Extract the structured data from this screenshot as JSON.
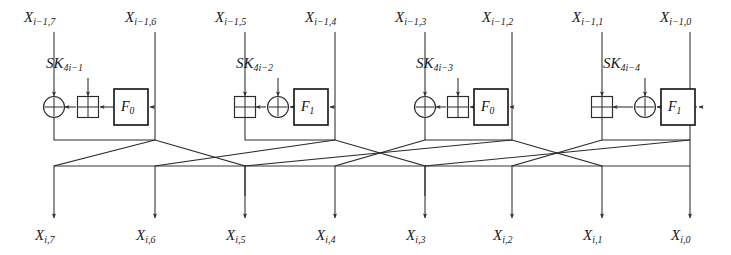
{
  "figure": {
    "name": "cipher-round-diagram",
    "type": "diagram",
    "line_color": "#2b2b2b",
    "text_color": "#1a1a1a",
    "background": "#ffffff"
  },
  "inputs": [
    {
      "base": "X",
      "sub": "i−1,7",
      "x": 54
    },
    {
      "base": "X",
      "sub": "i−1,6",
      "x": 155
    },
    {
      "base": "X",
      "sub": "i−1,5",
      "x": 245
    },
    {
      "base": "X",
      "sub": "i−1,4",
      "x": 335
    },
    {
      "base": "X",
      "sub": "i−1,3",
      "x": 425
    },
    {
      "base": "X",
      "sub": "i−1,2",
      "x": 512
    },
    {
      "base": "X",
      "sub": "i−1,1",
      "x": 602
    },
    {
      "base": "X",
      "sub": "i−1,0",
      "x": 690
    }
  ],
  "outputs": [
    {
      "base": "X",
      "sub": "i,7",
      "x": 54
    },
    {
      "base": "X",
      "sub": "i,6",
      "x": 155
    },
    {
      "base": "X",
      "sub": "i,5",
      "x": 245
    },
    {
      "base": "X",
      "sub": "i,4",
      "x": 335
    },
    {
      "base": "X",
      "sub": "i,3",
      "x": 425
    },
    {
      "base": "X",
      "sub": "i,2",
      "x": 512
    },
    {
      "base": "X",
      "sub": "i,1",
      "x": 602
    },
    {
      "base": "X",
      "sub": "i,0",
      "x": 690
    }
  ],
  "subkeys": [
    {
      "base": "SK",
      "sub": "4i−1",
      "x": 88,
      "y": 68
    },
    {
      "base": "SK",
      "sub": "4i−2",
      "x": 278,
      "y": 68
    },
    {
      "base": "SK",
      "sub": "4i−3",
      "x": 458,
      "y": 68
    },
    {
      "base": "SK",
      "sub": "4i−4",
      "x": 645,
      "y": 68
    }
  ],
  "functions": [
    {
      "base": "F",
      "sub": "0",
      "x": 131,
      "y": 107
    },
    {
      "base": "F",
      "sub": "1",
      "x": 311,
      "y": 107
    },
    {
      "base": "F",
      "sub": "0",
      "x": 491,
      "y": 107
    },
    {
      "base": "F",
      "sub": "1",
      "x": 678,
      "y": 107
    }
  ],
  "groups": [
    {
      "index": 1,
      "function_label": "F0",
      "target_branch": "X_{i-1,7}",
      "source_branch": "X_{i-1,6}",
      "subkey": "SK_{4i-1}",
      "left_operator": "xor-circle",
      "right_operator": "add-square"
    },
    {
      "index": 2,
      "function_label": "F1",
      "target_branch": "X_{i-1,5}",
      "source_branch": "X_{i-1,4}",
      "subkey": "SK_{4i-2}",
      "left_operator": "add-square",
      "right_operator": "xor-circle"
    },
    {
      "index": 3,
      "function_label": "F0",
      "target_branch": "X_{i-1,3}",
      "source_branch": "X_{i-1,2}",
      "subkey": "SK_{4i-3}",
      "left_operator": "xor-circle",
      "right_operator": "add-square"
    },
    {
      "index": 4,
      "function_label": "F1",
      "target_branch": "X_{i-1,1}",
      "source_branch": "X_{i-1,0}",
      "subkey": "SK_{4i-4}",
      "left_operator": "add-square",
      "right_operator": "xor-circle"
    }
  ],
  "operators": {
    "xor_symbol": "⊕",
    "add_symbol": "⊞",
    "xor_name": "xor-circle-operator",
    "add_name": "modular-add-square-operator"
  }
}
